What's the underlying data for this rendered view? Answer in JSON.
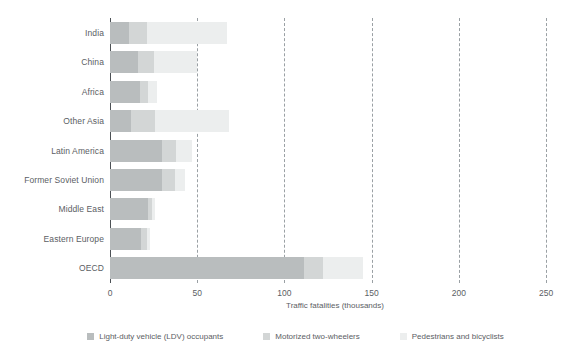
{
  "chart_data": {
    "type": "bar",
    "orientation": "horizontal",
    "stacked": true,
    "title": "",
    "xlabel": "Traffic fatalities (thousands)",
    "ylabel": "",
    "xlim": [
      0,
      258
    ],
    "xticks": [
      0,
      50,
      100,
      150,
      200,
      250
    ],
    "xticklabels": [
      "0",
      "50",
      "100",
      "150",
      "200",
      "250"
    ],
    "grid": "vertical dashed gridlines at 50, 100, 150, 200, 250",
    "legend_position": "bottom",
    "categories": [
      "India",
      "China",
      "Africa",
      "Other Asia",
      "Latin America",
      "Former Soviet Union",
      "Middle East",
      "Eastern Europe",
      "OECD"
    ],
    "series": [
      {
        "name": "Light-duty vehicle (LDV) occupants",
        "color": "#b9bdbe",
        "values": [
          11,
          16,
          17,
          12,
          30,
          30,
          22,
          18,
          111
        ]
      },
      {
        "name": "Motorized two-wheelers",
        "color": "#d3d6d6",
        "values": [
          10,
          9,
          5,
          14,
          8,
          7,
          2,
          3,
          11
        ]
      },
      {
        "name": "Pedestrians and bicyclists",
        "color": "#eceeee",
        "values": [
          46,
          25,
          5,
          42,
          9,
          6,
          2,
          2,
          23
        ]
      }
    ],
    "totals": [
      67,
      50,
      27,
      68,
      47,
      43,
      26,
      23,
      145
    ]
  },
  "legend": {
    "items": [
      {
        "label": "Light-duty vehicle (LDV) occupants",
        "color": "#b9bdbe"
      },
      {
        "label": "Motorized two-wheelers",
        "color": "#d3d6d6"
      },
      {
        "label": "Pedestrians and bicyclists",
        "color": "#eceeee"
      }
    ]
  },
  "axis": {
    "x_title": "Traffic fatalities (thousands)"
  },
  "colors": {
    "ldv": "#b9bdbe",
    "two_wheelers": "#d3d6d6",
    "pedestrians": "#eceeee",
    "axis": "#4c5155",
    "grid": "#9aa0a4",
    "text": "#5b6064",
    "background": "#ffffff"
  }
}
